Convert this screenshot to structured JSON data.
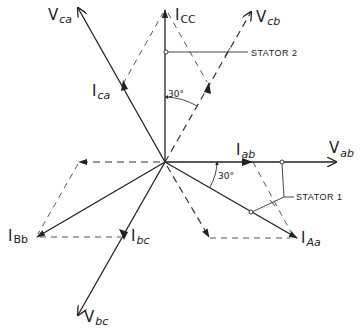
{
  "diagram": {
    "type": "phasor-diagram",
    "origin": [
      165,
      162
    ],
    "phasors": [
      {
        "id": "V_ab",
        "label": "V",
        "sub": "ab",
        "style": "solid",
        "tip": [
          336,
          162
        ]
      },
      {
        "id": "I_ab",
        "label": "I",
        "sub": "ab",
        "style": "solid",
        "on": "V_ab",
        "arrow_at": [
          252,
          162
        ]
      },
      {
        "id": "I_cc",
        "label": "I",
        "sub": "CC",
        "style": "solid",
        "tip": [
          165,
          10
        ]
      },
      {
        "id": "V_cb",
        "label": "V",
        "sub": "cb",
        "style": "dashed",
        "tip": [
          251,
          12
        ]
      },
      {
        "id": "I_cb",
        "style": "dashed",
        "on": "V_cb",
        "arrow_at": [
          208,
          85
        ]
      },
      {
        "id": "V_ca",
        "label": "V",
        "sub": "ca",
        "style": "solid",
        "tip": [
          78,
          8
        ]
      },
      {
        "id": "I_ca",
        "label": "I",
        "sub": "ca",
        "style": "solid",
        "on": "V_ca",
        "arrow_at": [
          123,
          84
        ]
      },
      {
        "id": "I_Bb",
        "label": "I",
        "sub": "Bb",
        "style": "solid",
        "tip": [
          37,
          237
        ]
      },
      {
        "id": "I_bc",
        "label": "I",
        "sub": "bc",
        "style": "solid",
        "on": "V_bc",
        "arrow_at": [
          124,
          235
        ]
      },
      {
        "id": "V_bc",
        "label": "V",
        "sub": "bc",
        "style": "solid",
        "tip": [
          78,
          315
        ]
      },
      {
        "id": "I_Aa",
        "label": "I",
        "sub": "Aa",
        "style": "solid",
        "tip": [
          297,
          238
        ]
      },
      {
        "id": "neg_I_ab",
        "style": "dashed",
        "tip": [
          79,
          162
        ]
      },
      {
        "id": "neg_I_ca",
        "style": "dashed",
        "tip": [
          209,
          237
        ]
      }
    ],
    "annotations": {
      "stator1": "STATOR 1",
      "stator2": "STATOR 2",
      "angle_upper": "30°",
      "angle_lower": "30°"
    },
    "labels": {
      "V_ca": {
        "main": "V",
        "sub": "ca"
      },
      "I_cc": {
        "main": "I",
        "sub": "CC"
      },
      "V_cb": {
        "main": "V",
        "sub": "cb"
      },
      "I_ca": {
        "main": "I",
        "sub": "ca"
      },
      "I_ab": {
        "main": "I",
        "sub": "ab"
      },
      "V_ab": {
        "main": "V",
        "sub": "ab"
      },
      "I_Bb": {
        "main": "I",
        "sub": "Bb"
      },
      "I_bc": {
        "main": "I",
        "sub": "bc"
      },
      "I_Aa": {
        "main": "I",
        "sub": "Aa"
      },
      "V_bc": {
        "main": "V",
        "sub": "bc"
      }
    },
    "colors": {
      "ink": "#222222",
      "background": "#ffffff"
    }
  }
}
